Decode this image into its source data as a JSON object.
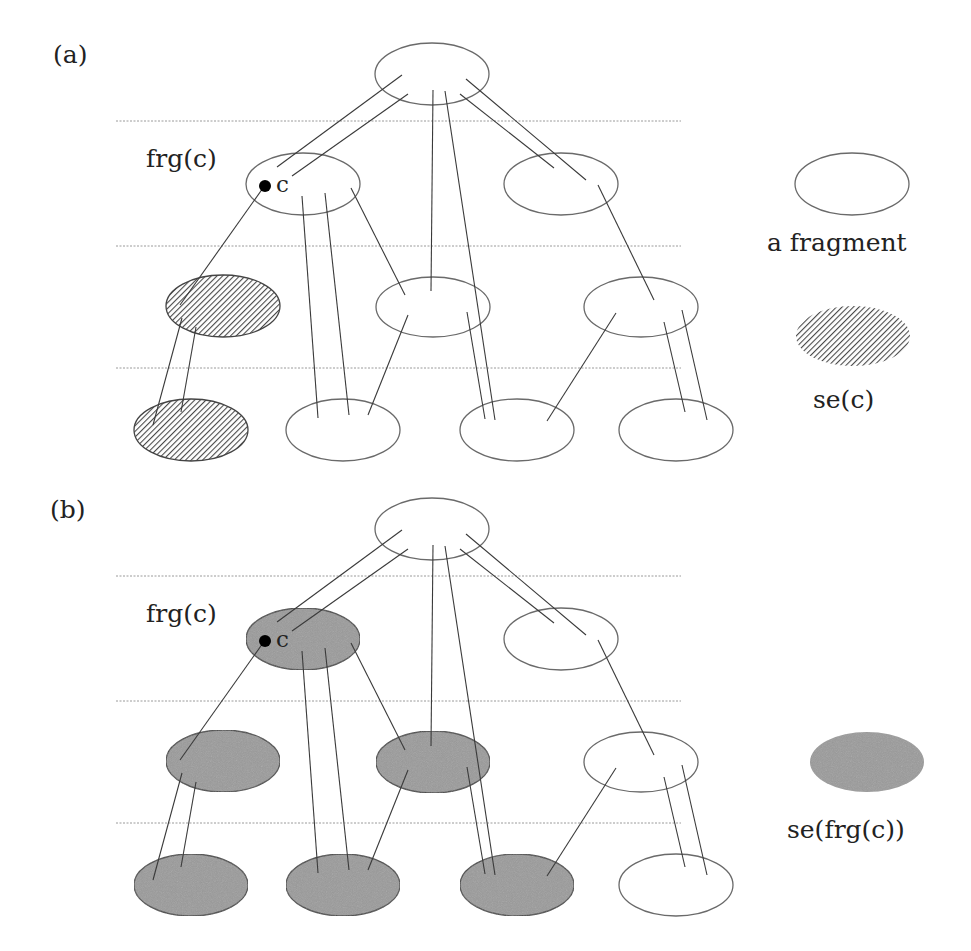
{
  "panels": [
    {
      "id": "a",
      "label": "(a)",
      "node_label": "frg(c)",
      "point_label": "c",
      "legend": [
        {
          "style": "plain",
          "label": "a fragment"
        },
        {
          "style": "hatched",
          "label": "se(c)"
        }
      ]
    },
    {
      "id": "b",
      "label": "(b)",
      "node_label": "frg(c)",
      "point_label": "c",
      "legend": [
        {
          "style": "gray",
          "label": "se(frg(c))"
        }
      ]
    }
  ],
  "diagram": {
    "levels": 4,
    "panel_offset_y": 455,
    "colors": {
      "stroke": "#6a6a6a",
      "line": "#3a3a3a",
      "hatch": "#555555",
      "gray_fill": "#9a9a9a",
      "dotted": "#9a9a9a"
    },
    "nodes": [
      {
        "id": "root",
        "level": 0,
        "cx": 432,
        "cy": 74,
        "fill_a": "plain",
        "fill_b": "plain"
      },
      {
        "id": "frg_c",
        "level": 1,
        "cx": 303,
        "cy": 184,
        "fill_a": "plain",
        "fill_b": "gray"
      },
      {
        "id": "r1",
        "level": 1,
        "cx": 561,
        "cy": 184,
        "fill_a": "plain",
        "fill_b": "plain"
      },
      {
        "id": "l2a",
        "level": 2,
        "cx": 223,
        "cy": 306,
        "fill_a": "hatched",
        "fill_b": "gray"
      },
      {
        "id": "l2b",
        "level": 2,
        "cx": 433,
        "cy": 307,
        "fill_a": "plain",
        "fill_b": "gray"
      },
      {
        "id": "l2c",
        "level": 2,
        "cx": 641,
        "cy": 307,
        "fill_a": "plain",
        "fill_b": "plain"
      },
      {
        "id": "l3a",
        "level": 3,
        "cx": 191,
        "cy": 430,
        "fill_a": "hatched",
        "fill_b": "gray"
      },
      {
        "id": "l3b",
        "level": 3,
        "cx": 343,
        "cy": 430,
        "fill_a": "plain",
        "fill_b": "gray"
      },
      {
        "id": "l3c",
        "level": 3,
        "cx": 517,
        "cy": 430,
        "fill_a": "plain",
        "fill_b": "gray"
      },
      {
        "id": "l3d",
        "level": 3,
        "cx": 676,
        "cy": 430,
        "fill_a": "plain",
        "fill_b": "plain"
      }
    ]
  }
}
